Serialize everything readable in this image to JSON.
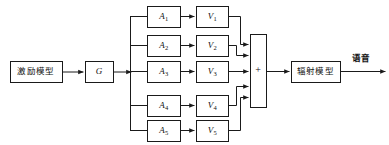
{
  "diagram": {
    "background_color": "#ffffff",
    "line_color": "#1a1a1a",
    "blocks": {
      "excitation": {
        "label": "激励模型",
        "x": 10,
        "y": 61,
        "w": 52,
        "h": 21
      },
      "gain": {
        "label": "G",
        "x": 85,
        "y": 61,
        "w": 28,
        "h": 21
      },
      "summer": {
        "label": "+",
        "x": 250,
        "y": 34,
        "w": 16,
        "h": 73
      },
      "radiation": {
        "label": "辐射模型",
        "x": 291,
        "y": 61,
        "w": 49,
        "h": 21
      }
    },
    "output": {
      "label": "语音",
      "x": 352,
      "y": 53
    },
    "branches": [
      {
        "a_label": "A",
        "a_sub": "1",
        "v_label": "V",
        "v_sub": "1",
        "row_y": 6
      },
      {
        "a_label": "A",
        "a_sub": "2",
        "v_label": "V",
        "v_sub": "2",
        "row_y": 35
      },
      {
        "a_label": "A",
        "a_sub": "3",
        "v_label": "V",
        "v_sub": "3",
        "row_y": 61
      },
      {
        "a_label": "A",
        "a_sub": "4",
        "v_label": "V",
        "v_sub": "4",
        "row_y": 95
      },
      {
        "a_label": "A",
        "a_sub": "5",
        "v_label": "V",
        "v_sub": "5",
        "row_y": 120
      }
    ],
    "branch_geometry": {
      "a_x": 147,
      "a_w": 33,
      "v_x": 196,
      "v_w": 32,
      "box_h": 21,
      "bus_x": 130,
      "merge_x": 240
    }
  }
}
